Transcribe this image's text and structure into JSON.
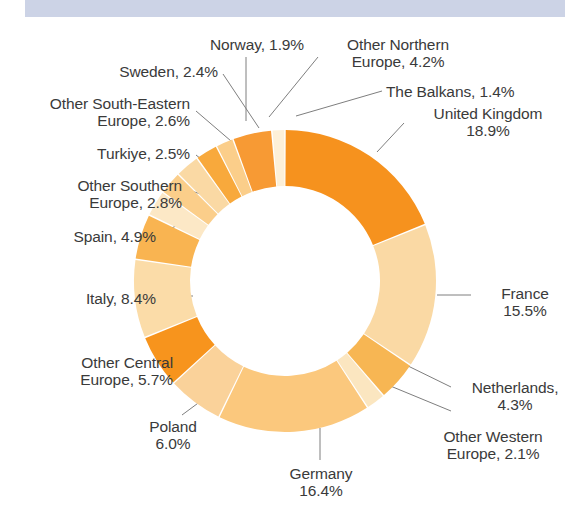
{
  "banner": {
    "title": "Figure 3. Origin of arrivals by country, Europe",
    "background_color": "#ccd3e6",
    "text_color": "#1d2a4d"
  },
  "chart_data": {
    "type": "pie",
    "variant": "donut",
    "title": "",
    "xlabel": "",
    "ylabel": "",
    "units": "percent",
    "start_angle_deg": 0,
    "direction": "clockwise",
    "legend_position": "callout-labels",
    "grid": false,
    "center": {
      "x": 285,
      "y": 281
    },
    "outer_radius": 151,
    "inner_radius": 95,
    "categories": [
      "United Kingdom",
      "France",
      "Netherlands",
      "Other Western Europe",
      "Germany",
      "Poland",
      "Other Central Europe",
      "Italy",
      "Spain",
      "Other Southern Europe",
      "Turkiye",
      "Other South-Eastern Europe",
      "Sweden",
      "Norway",
      "Other Northern Europe",
      "The Balkans"
    ],
    "values": [
      18.9,
      15.5,
      4.3,
      2.1,
      16.4,
      6.0,
      5.7,
      8.4,
      4.9,
      2.8,
      2.5,
      2.6,
      2.4,
      1.9,
      4.2,
      1.4
    ],
    "colors": [
      "#F6921E",
      "#FAD9A4",
      "#F7B653",
      "#FBE6C0",
      "#FBC87D",
      "#FAD29A",
      "#F7941D",
      "#FBDCA8",
      "#F9B451",
      "#FCE8C6",
      "#FBCE8A",
      "#FAD9A4",
      "#F8A93C",
      "#FBCE8A",
      "#F79A34",
      "#FDF0D8"
    ],
    "slices": [
      {
        "label": "United Kingdom",
        "value": 18.9,
        "color": "#F6921E"
      },
      {
        "label": "France",
        "value": 15.5,
        "color": "#FAD9A4"
      },
      {
        "label": "Netherlands",
        "value": 4.3,
        "color": "#F7B653"
      },
      {
        "label": "Other Western Europe",
        "value": 2.1,
        "color": "#FBE6C0"
      },
      {
        "label": "Germany",
        "value": 16.4,
        "color": "#FBC87D"
      },
      {
        "label": "Poland",
        "value": 6.0,
        "color": "#FAD29A"
      },
      {
        "label": "Other Central Europe",
        "value": 5.7,
        "color": "#F7941D"
      },
      {
        "label": "Italy",
        "value": 8.4,
        "color": "#FBDCA8"
      },
      {
        "label": "Spain",
        "value": 4.9,
        "color": "#F9B451"
      },
      {
        "label": "Other Southern Europe",
        "value": 2.8,
        "color": "#FCE8C6"
      },
      {
        "label": "Turkiye",
        "value": 2.5,
        "color": "#FBCE8A"
      },
      {
        "label": "Other South-Eastern Europe",
        "value": 2.6,
        "color": "#FAD9A4"
      },
      {
        "label": "Sweden",
        "value": 2.4,
        "color": "#F8A93C"
      },
      {
        "label": "Norway",
        "value": 1.9,
        "color": "#FBCE8A"
      },
      {
        "label": "Other Northern Europe",
        "value": 4.2,
        "color": "#F79A34"
      },
      {
        "label": "The Balkans",
        "value": 1.4,
        "color": "#FDF0D8"
      }
    ]
  },
  "callouts": [
    {
      "id": "norway",
      "text": "Norway, 1.9%",
      "x": 192,
      "y": 36,
      "w": 130,
      "align": "c"
    },
    {
      "id": "other-northern",
      "text": "Other Northern\nEurope, 4.2%",
      "x": 323,
      "y": 36,
      "w": 150,
      "align": "c"
    },
    {
      "id": "sweden",
      "text": "Sweden, 2.4%",
      "x": 88,
      "y": 63,
      "w": 130,
      "align": "r"
    },
    {
      "id": "the-balkans",
      "text": "The Balkans, 1.4%",
      "x": 386,
      "y": 83,
      "w": 170,
      "align": "l"
    },
    {
      "id": "other-south-eastern",
      "text": "Other South-Eastern\nEurope, 2.6%",
      "x": 3,
      "y": 95,
      "w": 187,
      "align": "r"
    },
    {
      "id": "united-kingdom",
      "text": "United Kingdom\n18.9%",
      "x": 408,
      "y": 105,
      "w": 160,
      "align": "c"
    },
    {
      "id": "turkiye",
      "text": "Turkiye, 2.5%",
      "x": 50,
      "y": 145,
      "w": 140,
      "align": "r"
    },
    {
      "id": "other-southern",
      "text": "Other Southern\nEurope, 2.8%",
      "x": 30,
      "y": 177,
      "w": 152,
      "align": "r"
    },
    {
      "id": "spain",
      "text": "Spain, 4.9%",
      "x": 36,
      "y": 228,
      "w": 120,
      "align": "r"
    },
    {
      "id": "france",
      "text": "France\n15.5%",
      "x": 475,
      "y": 285,
      "w": 100,
      "align": "c"
    },
    {
      "id": "italy",
      "text": "Italy, 8.4%",
      "x": 36,
      "y": 290,
      "w": 120,
      "align": "r"
    },
    {
      "id": "other-central",
      "text": "Other Central\nEurope, 5.7%",
      "x": 28,
      "y": 354,
      "w": 145,
      "align": "r"
    },
    {
      "id": "netherlands",
      "text": "Netherlands,\n4.3%",
      "x": 455,
      "y": 379,
      "w": 120,
      "align": "c"
    },
    {
      "id": "poland",
      "text": "Poland\n6.0%",
      "x": 118,
      "y": 418,
      "w": 110,
      "align": "c"
    },
    {
      "id": "other-western",
      "text": "Other Western\nEurope, 2.1%",
      "x": 418,
      "y": 428,
      "w": 150,
      "align": "c"
    },
    {
      "id": "germany",
      "text": "Germany\n16.4%",
      "x": 266,
      "y": 465,
      "w": 110,
      "align": "c"
    }
  ],
  "leader_lines": [
    {
      "id": "leader-norway",
      "points": "246,57 246,121"
    },
    {
      "id": "leader-other-northern",
      "points": "318,57 269,117"
    },
    {
      "id": "leader-sweden",
      "points": "223,74 259,128"
    },
    {
      "id": "leader-the-balkans",
      "points": "382,91 296,116"
    },
    {
      "id": "leader-other-south-eastern",
      "points": "196,111 231,141"
    },
    {
      "id": "leader-united-kingdom",
      "points": "404,123 377,152"
    },
    {
      "id": "leader-turkiye",
      "points": "196,155 215,170"
    },
    {
      "id": "leader-other-southern",
      "points": "188,190 217,199"
    },
    {
      "id": "leader-spain",
      "points": "162,232 195,218"
    },
    {
      "id": "leader-france",
      "points": "471,295 437,295"
    },
    {
      "id": "leader-italy",
      "points": "162,296 193,296"
    },
    {
      "id": "leader-other-central",
      "points": "179,362 208,349"
    },
    {
      "id": "leader-netherlands",
      "points": "451,387 404,364"
    },
    {
      "id": "leader-netherlands-2",
      "points": "451,411 388,385"
    },
    {
      "id": "leader-poland",
      "points": "182,415 209,395"
    },
    {
      "id": "leader-germany",
      "points": "320,460 320,428"
    }
  ]
}
